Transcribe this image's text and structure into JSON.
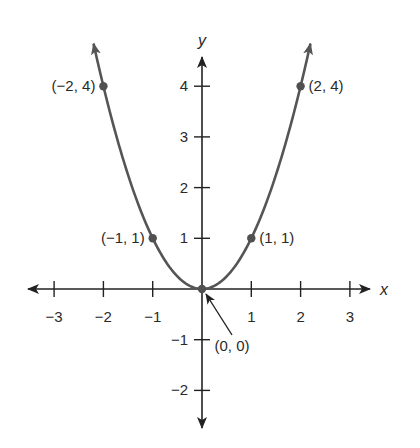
{
  "chart_data": {
    "type": "line",
    "title": "",
    "function": "y = x^2",
    "xlabel": "x",
    "ylabel": "y",
    "xlim": [
      -3.5,
      3.6
    ],
    "ylim": [
      -2.6,
      4.9
    ],
    "grid": false,
    "x_ticks": [
      -3,
      -2,
      -1,
      1,
      2,
      3
    ],
    "x_tick_labels": [
      "−3",
      "−2",
      "−1",
      "1",
      "2",
      "3"
    ],
    "y_ticks": [
      -2,
      -1,
      1,
      2,
      3,
      4
    ],
    "y_tick_labels": [
      "−2",
      "−1",
      "1",
      "2",
      "3",
      "4"
    ],
    "series": [
      {
        "name": "parabola",
        "x": [
          -2.2,
          -2,
          -1.5,
          -1,
          -0.5,
          0,
          0.5,
          1,
          1.5,
          2,
          2.2
        ],
        "values": [
          4.84,
          4,
          2.25,
          1,
          0.25,
          0,
          0.25,
          1,
          2.25,
          4,
          4.84
        ],
        "color": "#555555"
      }
    ],
    "points": [
      {
        "x": -2,
        "y": 4,
        "label": "(−2, 4)"
      },
      {
        "x": 2,
        "y": 4,
        "label": "(2, 4)"
      },
      {
        "x": -1,
        "y": 1,
        "label": "(−1, 1)"
      },
      {
        "x": 1,
        "y": 1,
        "label": "(1, 1)"
      },
      {
        "x": 0,
        "y": 0,
        "label": "(0, 0)"
      }
    ],
    "annotations": [
      {
        "text": "(0, 0)",
        "type": "arrow-callout",
        "target": [
          0,
          0
        ]
      }
    ]
  },
  "colors": {
    "axis": "#222222",
    "curve": "#555555",
    "point": "#505050",
    "text": "#2a2a2a"
  }
}
